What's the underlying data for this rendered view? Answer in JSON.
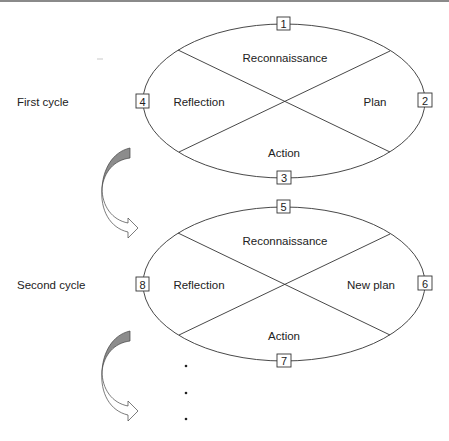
{
  "diagram": {
    "type": "action-research-cycle",
    "cycles": [
      {
        "label": "First cycle",
        "segments": {
          "top": "Reconnaissance",
          "right": "Plan",
          "bottom": "Action",
          "left": "Reflection"
        },
        "markers": {
          "top": "1",
          "right": "2",
          "bottom": "3",
          "left": "4"
        }
      },
      {
        "label": "Second cycle",
        "segments": {
          "top": "Reconnaissance",
          "right": "New plan",
          "bottom": "Action",
          "left": "Reflection"
        },
        "markers": {
          "top": "5",
          "right": "6",
          "bottom": "7",
          "left": "8"
        }
      }
    ],
    "continuation": "...",
    "colors": {
      "line": "#333333",
      "arrow_fill": "#8c8c8c",
      "background": "#ffffff"
    }
  }
}
